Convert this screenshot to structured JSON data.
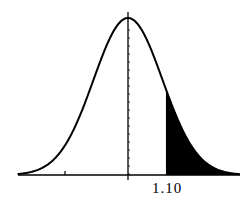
{
  "chart_data": {
    "type": "area",
    "title": "",
    "xlabel": "",
    "ylabel": "",
    "x_range": [
      -3.5,
      3.5
    ],
    "mean": 0,
    "sd": 1,
    "shaded_region": {
      "from": 1.1,
      "to": "infinity",
      "fill": "#000000"
    },
    "tick_labels": [
      {
        "x": 1.1,
        "label": "1.10"
      }
    ],
    "unlabeled_ticks": [
      -2
    ],
    "grid": false,
    "legend": null
  },
  "labels": {
    "z_value": "1.10"
  },
  "colors": {
    "curve": "#000000",
    "shade": "#000000",
    "background": "#ffffff"
  }
}
